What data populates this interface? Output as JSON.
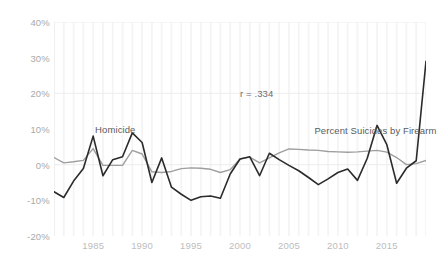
{
  "chart_data": {
    "type": "line",
    "title": "",
    "subtitle": "",
    "xlabel": "",
    "ylabel": "",
    "xlim": [
      1981,
      2019
    ],
    "ylim": [
      -20,
      40
    ],
    "yticks": [
      "-20%",
      "-10%",
      "0%",
      "10%",
      "20%",
      "30%",
      "40%"
    ],
    "ytick_values": [
      -20,
      -10,
      0,
      10,
      20,
      30,
      40
    ],
    "xticks": [
      "1985",
      "1990",
      "1995",
      "2000",
      "2005",
      "2010",
      "2015"
    ],
    "xtick_values": [
      1985,
      1990,
      1995,
      2000,
      2005,
      2010,
      2015
    ],
    "grid": "vertical-yearly-faint",
    "legend_position": "inline-annotations",
    "annotations": [
      {
        "text": "r = .334",
        "x": 2000,
        "y": 21.5,
        "name": "correlation-annotation"
      },
      {
        "text": "Homicide",
        "x": 1985.2,
        "y": 11.5,
        "name": "homicide-series-label"
      },
      {
        "text": "Percent Suicides by Firearm",
        "x": 2007.6,
        "y": 11.0,
        "name": "suicide-series-label"
      }
    ],
    "x": [
      1981,
      1982,
      1983,
      1984,
      1985,
      1986,
      1987,
      1988,
      1989,
      1990,
      1991,
      1992,
      1993,
      1994,
      1995,
      1996,
      1997,
      1998,
      1999,
      2000,
      2001,
      2002,
      2003,
      2004,
      2005,
      2006,
      2007,
      2008,
      2009,
      2010,
      2011,
      2012,
      2013,
      2014,
      2015,
      2016,
      2017,
      2018,
      2019
    ],
    "series": [
      {
        "name": "Homicide",
        "color": "#2b2b2b",
        "width": 1.6,
        "values": [
          -7.6,
          -9.2,
          -4.6,
          -1.1,
          8.0,
          -3.1,
          1.4,
          2.2,
          8.9,
          6.2,
          -5.0,
          1.9,
          -6.3,
          -8.3,
          -10.0,
          -9.0,
          -8.8,
          -9.4,
          -2.6,
          1.6,
          2.2,
          -3.1,
          3.2,
          1.4,
          -0.2,
          -1.7,
          -3.6,
          -5.6,
          -4.0,
          -2.2,
          -1.2,
          -4.4,
          1.8,
          11.0,
          5.6,
          -5.2,
          -1.0,
          1.1,
          29.0
        ]
      },
      {
        "name": "Percent Suicides by Firearm",
        "color": "#9e9e9e",
        "width": 1.4,
        "values": [
          2.0,
          0.5,
          0.8,
          1.2,
          4.5,
          -0.2,
          -0.2,
          -0.2,
          4.0,
          3.0,
          -2.0,
          -2.2,
          -1.9,
          -1.1,
          -0.9,
          -1.0,
          -1.3,
          -2.2,
          -1.4,
          1.6,
          2.1,
          0.5,
          1.9,
          3.3,
          4.4,
          4.3,
          4.1,
          4.0,
          3.7,
          3.6,
          3.5,
          3.6,
          3.8,
          4.0,
          3.5,
          2.0,
          0.0,
          0.3,
          1.2
        ]
      }
    ]
  }
}
